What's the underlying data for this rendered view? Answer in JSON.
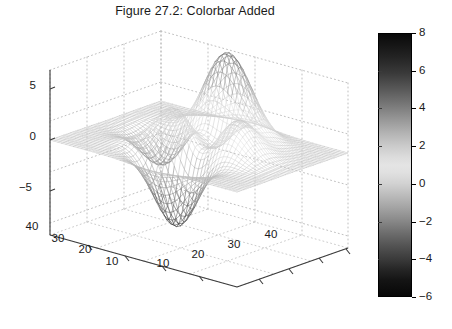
{
  "figure": {
    "title": "Figure 27.2: Colorbar Added",
    "background_color": "#ffffff",
    "text_color": "#1a1a1a"
  },
  "chart_data": {
    "type": "surface",
    "title": "Figure 27.2: Colorbar Added",
    "xlabel": "",
    "ylabel": "",
    "zlabel": "",
    "x_ticks": [
      10,
      20,
      30,
      40
    ],
    "x_tick_labels": [
      "10",
      "20",
      "30",
      "40"
    ],
    "y_ticks": [
      10,
      20,
      30,
      40
    ],
    "y_tick_labels": [
      "40",
      "30",
      "20",
      "10"
    ],
    "z_ticks": [
      -5,
      0,
      5
    ],
    "z_tick_labels": [
      "-5",
      "0",
      "5"
    ],
    "xlim": [
      1,
      49
    ],
    "ylim": [
      1,
      49
    ],
    "zlim": [
      -7,
      9
    ],
    "grid": true,
    "grid_style": "dotted",
    "mesh_color": "#8a8a8a",
    "view_azimuth": -37.5,
    "view_elevation": 30,
    "colormap": "jet-grayscale",
    "features": [
      {
        "name": "primary peak",
        "x": 17,
        "y": 30,
        "z": 8.1
      },
      {
        "name": "secondary bump",
        "x": 32,
        "y": 30,
        "z": 3.6
      },
      {
        "name": "deep valley",
        "x": 30,
        "y": 15,
        "z": -6.5
      },
      {
        "name": "shallow dip",
        "x": 13,
        "y": 20,
        "z": -3.1
      }
    ],
    "colorbar": {
      "orientation": "vertical",
      "position": "right",
      "min": -6,
      "max": 8,
      "ticks": [
        8,
        6,
        4,
        2,
        0,
        -2,
        -4,
        -6
      ],
      "tick_labels": [
        "8",
        "6",
        "4",
        "2",
        "0",
        "-2",
        "-4",
        "-6"
      ],
      "border_color": "#000000"
    }
  },
  "colorbar_ui": {
    "ticks": [
      {
        "label": "8",
        "pos_pct": 0.0
      },
      {
        "label": "6",
        "pos_pct": 14.29
      },
      {
        "label": "4",
        "pos_pct": 28.57
      },
      {
        "label": "2",
        "pos_pct": 42.86
      },
      {
        "label": "0",
        "pos_pct": 57.14
      },
      {
        "label": "-2",
        "pos_pct": 71.43
      },
      {
        "label": "-4",
        "pos_pct": 85.71
      },
      {
        "label": "-6",
        "pos_pct": 100.0
      }
    ]
  },
  "axes_labels": {
    "z": [
      {
        "label": "5",
        "x": 36,
        "y": 89
      },
      {
        "label": "0",
        "x": 36,
        "y": 140
      },
      {
        "label": "-5",
        "x": 32,
        "y": 191
      }
    ],
    "y_left": [
      {
        "label": "40",
        "x": 32,
        "y": 230
      },
      {
        "label": "30",
        "x": 58,
        "y": 242
      },
      {
        "label": "20",
        "x": 85,
        "y": 253
      },
      {
        "label": "10",
        "x": 112,
        "y": 265
      }
    ],
    "x_right": [
      {
        "label": "10",
        "x": 163,
        "y": 267
      },
      {
        "label": "20",
        "x": 198,
        "y": 258
      },
      {
        "label": "30",
        "x": 234,
        "y": 248
      },
      {
        "label": "40",
        "x": 271,
        "y": 238
      }
    ]
  }
}
